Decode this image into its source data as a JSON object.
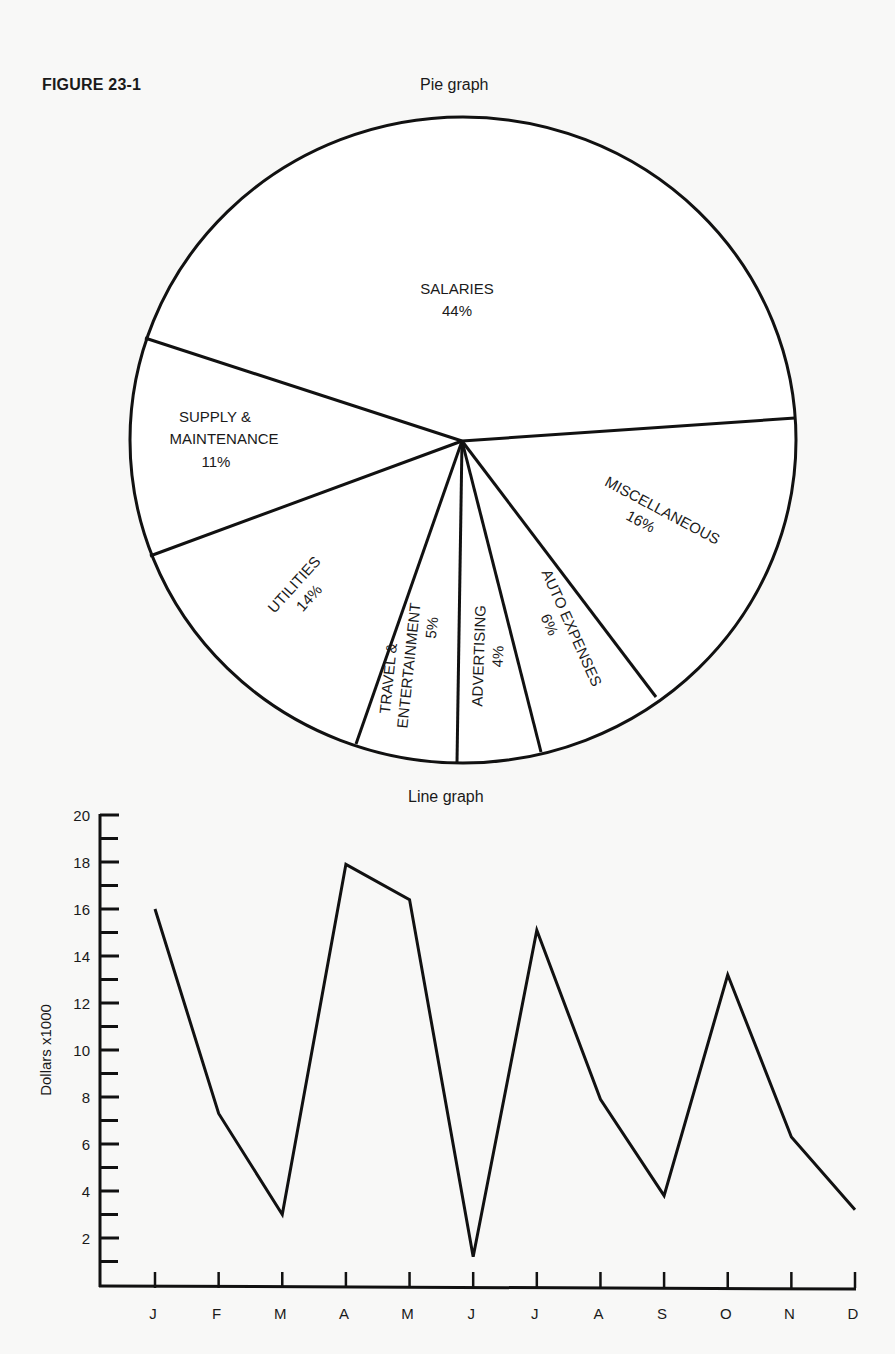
{
  "figure_label": "FIGURE 23-1",
  "pie": {
    "title": "Pie graph",
    "slices": [
      {
        "label": "SALARIES",
        "pct": "44%"
      },
      {
        "label": "MISCELLANEOUS",
        "pct": "16%"
      },
      {
        "label": "AUTO EXPENSES",
        "pct": "6%"
      },
      {
        "label": "ADVERTISING",
        "pct": "4%"
      },
      {
        "label": "TRAVEL &",
        "label2": "ENTERTAINMENT",
        "pct": "5%"
      },
      {
        "label": "UTILITIES",
        "pct": "14%"
      },
      {
        "label": "SUPPLY &",
        "label2": "MAINTENANCE",
        "pct": "11%"
      }
    ]
  },
  "line": {
    "title": "Line graph",
    "ylabel": "Dollars  x1000",
    "yticks": [
      "2",
      "4",
      "6",
      "8",
      "10",
      "12",
      "14",
      "16",
      "18",
      "20"
    ],
    "xticks": [
      "J",
      "F",
      "M",
      "A",
      "M",
      "J",
      "J",
      "A",
      "S",
      "O",
      "N",
      "D"
    ]
  },
  "chart_data": [
    {
      "type": "pie",
      "title": "Pie graph",
      "categories": [
        "Salaries",
        "Miscellaneous",
        "Auto Expenses",
        "Advertising",
        "Travel & Entertainment",
        "Utilities",
        "Supply & Maintenance"
      ],
      "values": [
        44,
        16,
        6,
        4,
        5,
        14,
        11
      ],
      "unit": "%"
    },
    {
      "type": "line",
      "title": "Line graph",
      "xlabel": "",
      "ylabel": "Dollars x1000",
      "categories": [
        "J",
        "F",
        "M",
        "A",
        "M",
        "J",
        "J",
        "A",
        "S",
        "O",
        "N",
        "D"
      ],
      "values": [
        16,
        7.3,
        3,
        17.9,
        16.4,
        1.2,
        15.1,
        7.9,
        3.8,
        13.2,
        6.3,
        3.2
      ],
      "ylim": [
        0,
        20
      ],
      "yticks": [
        2,
        4,
        6,
        8,
        10,
        12,
        14,
        16,
        18,
        20
      ],
      "minor_ticks_every": 1,
      "grid": false,
      "legend": null
    }
  ]
}
